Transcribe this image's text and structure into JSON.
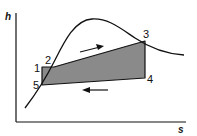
{
  "diagram": {
    "type": "h-s diagram (refrigeration cycle)",
    "axes": {
      "y_label": "h",
      "x_label": "s"
    },
    "points": [
      {
        "id": "1",
        "label": "1"
      },
      {
        "id": "2",
        "label": "2"
      },
      {
        "id": "3",
        "label": "3"
      },
      {
        "id": "4",
        "label": "4"
      },
      {
        "id": "5",
        "label": "5"
      }
    ],
    "colors": {
      "cycle_fill": "#8a8a8a",
      "line": "#111111",
      "background": "#ffffff"
    },
    "arrows": [
      {
        "name": "forward-arrow",
        "direction": "right"
      },
      {
        "name": "return-arrow",
        "direction": "left"
      }
    ]
  }
}
